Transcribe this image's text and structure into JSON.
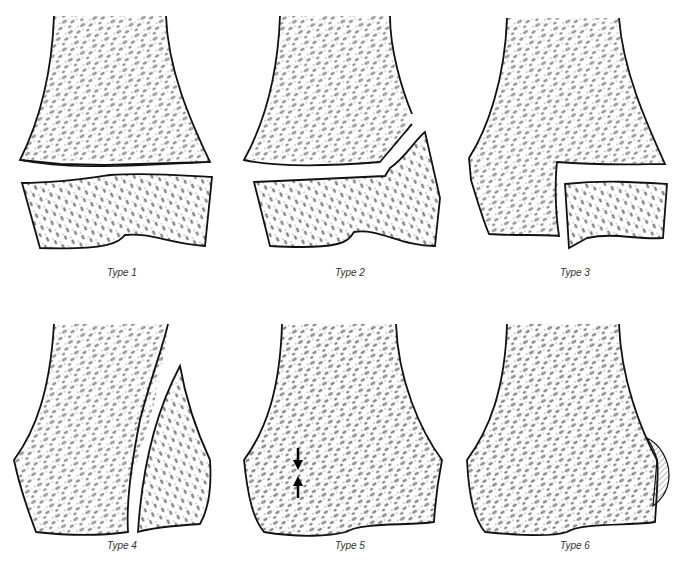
{
  "diagram": {
    "colors": {
      "outline": "#111111",
      "trabecular": "#222222",
      "background": "#ffffff",
      "hatch": "#555555"
    },
    "panels": [
      {
        "id": "type1",
        "label": "Type 1",
        "description": "Complete separation through the physis; metaphysis and epiphysis displaced"
      },
      {
        "id": "type2",
        "label": "Type 2",
        "description": "Fracture through physis exiting through metaphysis (metaphyseal fragment)"
      },
      {
        "id": "type3",
        "label": "Type 3",
        "description": "Fracture through physis exiting through epiphysis into joint"
      },
      {
        "id": "type4",
        "label": "Type 4",
        "description": "Vertical fracture through metaphysis, physis and epiphysis"
      },
      {
        "id": "type5",
        "label": "Type 5",
        "description": "Crush injury of physis indicated by opposing arrows",
        "annotations": [
          "arrow-down",
          "arrow-up"
        ]
      },
      {
        "id": "type6",
        "label": "Type 6",
        "description": "Perichondral ring injury with hatched peripheral lesion",
        "annotations": [
          "hatched-region"
        ]
      }
    ]
  }
}
